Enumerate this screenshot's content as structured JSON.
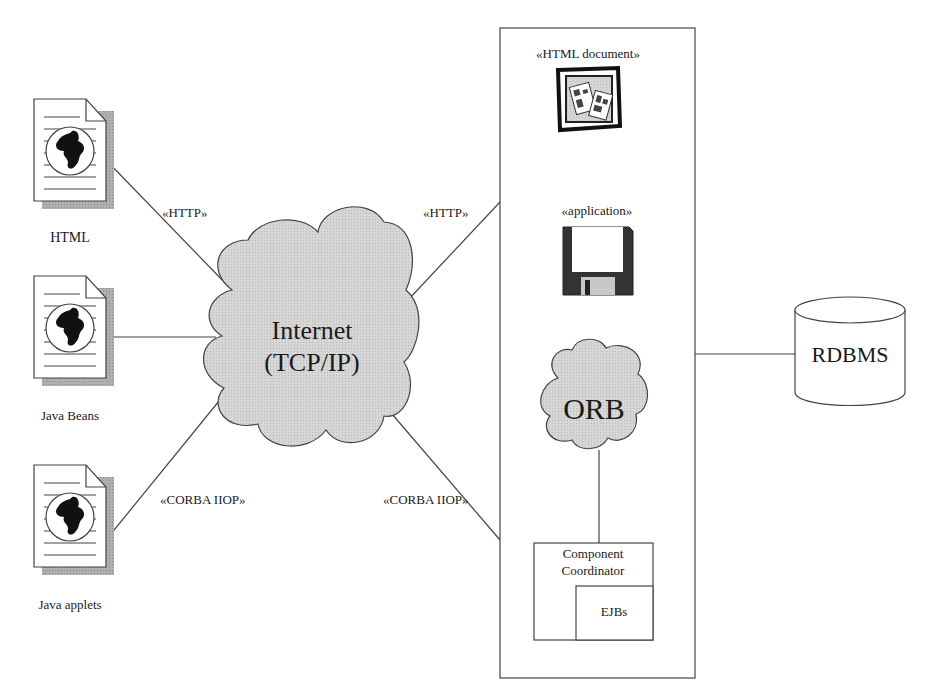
{
  "clients": [
    {
      "label": "HTML",
      "icon": "web-document-icon"
    },
    {
      "label": "Java Beans",
      "icon": "web-document-icon"
    },
    {
      "label": "Java applets",
      "icon": "web-document-icon"
    }
  ],
  "internet": {
    "line1": "Internet",
    "line2": "(TCP/IP)"
  },
  "connections": {
    "html_to_internet": "«HTTP»",
    "applets_to_internet": "«CORBA IIOP»",
    "internet_to_server_http": "«HTTP»",
    "internet_to_server_corba": "«CORBA IIOP»"
  },
  "server": {
    "html_document": "«HTML document»",
    "application": "«application»",
    "orb": "ORB",
    "component_coordinator_line1": "Component",
    "component_coordinator_line2": "Coordinator",
    "ejbs": "EJBs"
  },
  "database": {
    "label": "RDBMS"
  },
  "colors": {
    "cloud_fill": "#d3d3d3",
    "stroke": "#333333",
    "shadow": "#a9a9a9"
  }
}
